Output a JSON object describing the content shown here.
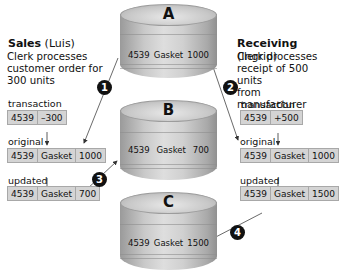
{
  "sales": {
    "title_bold": "Sales",
    "title_rest": " (Luis)",
    "description_lines": [
      "Clerk processes",
      "customer order for",
      "300 units"
    ],
    "transaction_label": "transaction",
    "transaction": [
      "4539",
      "–300"
    ],
    "original_label": "original",
    "original": [
      "4539",
      "Gasket",
      "1000"
    ],
    "updated_label": "updated",
    "updated": [
      "4539",
      "Gasket",
      "700"
    ]
  },
  "receiving": {
    "title_bold": "Receiving",
    "title_rest": " (Ingrid)",
    "description_lines": [
      "Clerk processes",
      "receipt of 500 units",
      "from manufacturer"
    ],
    "transaction_label": "transaction",
    "transaction": [
      "4539",
      "+500"
    ],
    "original_label": "original",
    "original": [
      "4539",
      "Gasket",
      "1000"
    ],
    "updated_label": "updated",
    "updated": [
      "4539",
      "Gasket",
      "1500"
    ]
  },
  "databases": {
    "A": {
      "label": "A",
      "record": [
        "4539",
        "Gasket",
        "1000"
      ]
    },
    "B": {
      "label": "B",
      "record": [
        "4539",
        "Gasket",
        "700"
      ]
    },
    "C": {
      "label": "C",
      "record": [
        "4539",
        "Gasket",
        "1500"
      ]
    }
  },
  "steps": [
    "1",
    "2",
    "3",
    "4"
  ],
  "colors": {
    "record_fill": "#d4d4d4",
    "badge": "#111111",
    "drum_mid": "#c9c9c9"
  }
}
